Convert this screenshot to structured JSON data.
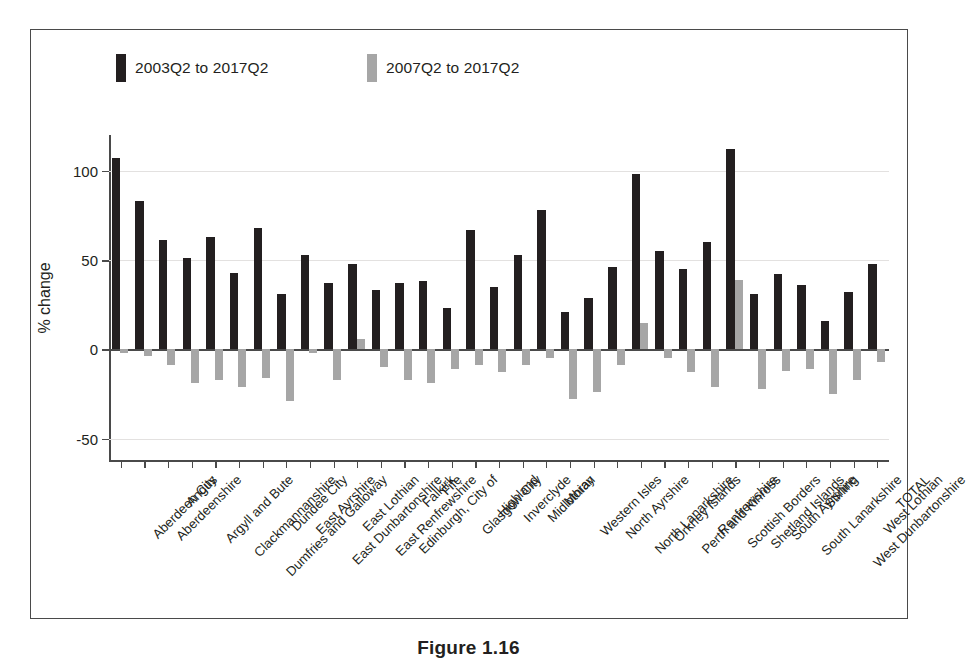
{
  "figure": {
    "caption": "Figure 1.16"
  },
  "chart_data": {
    "type": "bar",
    "title": "",
    "xlabel": "",
    "ylabel": "% change",
    "ylim": [
      -62,
      120
    ],
    "yticks": [
      -50,
      0,
      50,
      100
    ],
    "ytick_labels": [
      "-50",
      "0",
      "50",
      "100"
    ],
    "grid": true,
    "legend_position": "top",
    "colors": {
      "series1": "#231f20",
      "series2": "#a6a6a6",
      "axis": "#4a4a4a",
      "grid": "#e3e1e0"
    },
    "categories": [
      "Aberdeen City",
      "Aberdeenshire",
      "Angus",
      "Argyll and Bute",
      "Clackmannanshire",
      "Dumfries and Galloway",
      "Dundee City",
      "East Ayrshire",
      "East Dunbartonshire",
      "East Lothian",
      "East Renfrewshire",
      "Edinburgh, City of",
      "Falkirk",
      "Fife",
      "Glasgow City",
      "Highland",
      "Inverclyde",
      "Midlothian",
      "Moray",
      "Western Isles",
      "North Ayrshire",
      "North Lanarkshire",
      "Orkney Islands",
      "Perth and Kinross",
      "Renfrewshire",
      "Scottish Borders",
      "Shetland Islands",
      "South Ayrshire",
      "South Lanarkshire",
      "Stirling",
      "West Dunbartonshire",
      "West Lothian",
      "TOTAL"
    ],
    "series": [
      {
        "name": "2003Q2 to 2017Q2",
        "color": "#231f20",
        "values": [
          107,
          83,
          61,
          51,
          63,
          43,
          68,
          31,
          53,
          37,
          48,
          33,
          37,
          38,
          23,
          67,
          35,
          53,
          78,
          21,
          29,
          46,
          98,
          55,
          45,
          60,
          112,
          31,
          42,
          36,
          16,
          32,
          48
        ]
      },
      {
        "name": "2007Q2 to 2017Q2",
        "color": "#a6a6a6",
        "values": [
          -2,
          -4,
          -9,
          -19,
          -17,
          -21,
          -16,
          -29,
          -2,
          -17,
          6,
          -10,
          -17,
          -19,
          -11,
          -9,
          -13,
          -9,
          -5,
          -28,
          -24,
          -9,
          15,
          -5,
          -13,
          -21,
          39,
          -22,
          -12,
          -11,
          -25,
          -17,
          -7
        ]
      }
    ]
  }
}
